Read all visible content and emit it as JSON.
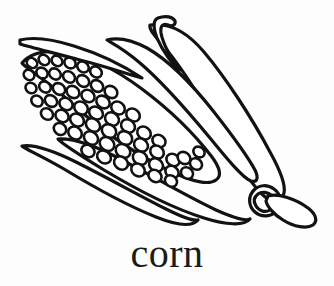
{
  "page": {
    "background_color": "#fdfdfd",
    "ink_color": "#121212"
  },
  "illustration": {
    "name": "corn-cob-line-art",
    "subject": "corn",
    "style": "black-and-white coloring-book line drawing",
    "stroke_color": "#121212",
    "fill_color": "#ffffff",
    "parts": [
      {
        "name": "cob-body",
        "label": "Corn cob"
      },
      {
        "name": "kernels",
        "label": "Kernels",
        "count": 96
      },
      {
        "name": "husk-leaf-upper-hooked",
        "label": "Upper hooked husk leaf"
      },
      {
        "name": "husk-leaf-upper-long",
        "label": "Upper long husk leaf"
      },
      {
        "name": "husk-leaf-right-outer",
        "label": "Outer right husk leaf"
      },
      {
        "name": "husk-leaf-lower",
        "label": "Lower husk leaf"
      },
      {
        "name": "husk-leaf-lower-left-thin",
        "label": "Thin lower-left husk leaf"
      },
      {
        "name": "stem-collar",
        "label": "Stem collar ring"
      },
      {
        "name": "stem",
        "label": "Stem stalk"
      }
    ]
  },
  "caption": {
    "text": "corn"
  }
}
